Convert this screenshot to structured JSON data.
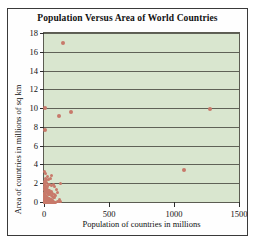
{
  "chart_data": {
    "type": "scatter",
    "title": "Population Versus Area of World Countries",
    "xlabel": "Population of countries in millions",
    "ylabel": "Area of countries in millions of sq km",
    "xlim": [
      0,
      1500
    ],
    "ylim": [
      0,
      18
    ],
    "xticks": [
      "0",
      "500",
      "1000",
      "1500"
    ],
    "xtick_values": [
      0,
      500,
      1000,
      1500
    ],
    "yticks": [
      "0",
      "2",
      "4",
      "6",
      "8",
      "10",
      "12",
      "14",
      "16",
      "18"
    ],
    "ytick_values": [
      0,
      2,
      4,
      6,
      8,
      10,
      12,
      14,
      16,
      18
    ],
    "grid": "horizontal",
    "legend": "none",
    "marker_color": "#c8796a",
    "plot_background": "#d9e6cf",
    "series": [
      {
        "name": "World countries",
        "points": [
          [
            145,
            16.9
          ],
          [
            1280,
            9.9
          ],
          [
            210,
            9.6
          ],
          [
            8,
            9.98
          ],
          [
            115,
            9.2
          ],
          [
            5,
            7.7
          ],
          [
            1080,
            3.4
          ],
          [
            128,
            2.0
          ],
          [
            60,
            2.8
          ],
          [
            48,
            2.5
          ],
          [
            38,
            2.4
          ],
          [
            30,
            2.7
          ],
          [
            22,
            2.4
          ],
          [
            18,
            2.1
          ],
          [
            14,
            2.3
          ],
          [
            10,
            2.0
          ],
          [
            8,
            2.5
          ],
          [
            6,
            2.2
          ],
          [
            36,
            1.9
          ],
          [
            44,
            1.9
          ],
          [
            56,
            1.8
          ],
          [
            70,
            1.9
          ],
          [
            82,
            1.6
          ],
          [
            96,
            1.3
          ],
          [
            104,
            1.0
          ],
          [
            2,
            1.9
          ],
          [
            3,
            1.6
          ],
          [
            5,
            1.5
          ],
          [
            7,
            1.3
          ],
          [
            9,
            1.6
          ],
          [
            11,
            1.4
          ],
          [
            13,
            1.2
          ],
          [
            15,
            1.5
          ],
          [
            17,
            1.3
          ],
          [
            19,
            1.1
          ],
          [
            21,
            1.4
          ],
          [
            23,
            1.2
          ],
          [
            25,
            1.0
          ],
          [
            27,
            1.3
          ],
          [
            29,
            0.9
          ],
          [
            31,
            1.2
          ],
          [
            33,
            0.8
          ],
          [
            35,
            1.1
          ],
          [
            40,
            0.9
          ],
          [
            43,
            1.2
          ],
          [
            46,
            0.8
          ],
          [
            50,
            1.0
          ],
          [
            54,
            0.7
          ],
          [
            58,
            1.1
          ],
          [
            64,
            0.6
          ],
          [
            68,
            0.9
          ],
          [
            74,
            0.5
          ],
          [
            78,
            0.8
          ],
          [
            84,
            0.45
          ],
          [
            90,
            0.7
          ],
          [
            1,
            1.0
          ],
          [
            2,
            0.8
          ],
          [
            3,
            0.6
          ],
          [
            4,
            0.9
          ],
          [
            5,
            0.7
          ],
          [
            6,
            0.5
          ],
          [
            7,
            0.8
          ],
          [
            8,
            0.6
          ],
          [
            9,
            0.4
          ],
          [
            10,
            0.7
          ],
          [
            11,
            0.55
          ],
          [
            12,
            0.35
          ],
          [
            13,
            0.65
          ],
          [
            14,
            0.45
          ],
          [
            15,
            0.3
          ],
          [
            16,
            0.6
          ],
          [
            17,
            0.4
          ],
          [
            18,
            0.25
          ],
          [
            19,
            0.55
          ],
          [
            20,
            0.35
          ],
          [
            21,
            0.2
          ],
          [
            22,
            0.5
          ],
          [
            23,
            0.3
          ],
          [
            24,
            0.18
          ],
          [
            25,
            0.45
          ],
          [
            26,
            0.28
          ],
          [
            27,
            0.15
          ],
          [
            28,
            0.4
          ],
          [
            30,
            0.25
          ],
          [
            32,
            0.12
          ],
          [
            34,
            0.38
          ],
          [
            36,
            0.22
          ],
          [
            38,
            0.1
          ],
          [
            41,
            0.33
          ],
          [
            45,
            0.2
          ],
          [
            49,
            0.28
          ],
          [
            53,
            0.15
          ],
          [
            57,
            0.24
          ],
          [
            62,
            0.12
          ],
          [
            66,
            0.2
          ],
          [
            72,
            0.1
          ],
          [
            0.5,
            0.45
          ],
          [
            1,
            0.3
          ],
          [
            1.5,
            0.18
          ],
          [
            2,
            0.12
          ],
          [
            2.5,
            0.35
          ],
          [
            3,
            0.22
          ],
          [
            3.5,
            0.1
          ],
          [
            4,
            0.28
          ],
          [
            4.5,
            0.15
          ],
          [
            5,
            0.08
          ],
          [
            5.5,
            0.25
          ],
          [
            6,
            0.13
          ],
          [
            6.5,
            0.06
          ],
          [
            7,
            0.2
          ],
          [
            7.5,
            0.1
          ],
          [
            8,
            0.05
          ],
          [
            8.5,
            0.17
          ],
          [
            9,
            0.08
          ],
          [
            9.5,
            0.04
          ],
          [
            10,
            0.14
          ],
          [
            11,
            0.07
          ],
          [
            12,
            0.03
          ],
          [
            13,
            0.11
          ],
          [
            14,
            0.06
          ],
          [
            15,
            0.02
          ],
          [
            16,
            0.09
          ],
          [
            17,
            0.05
          ],
          [
            18,
            0.02
          ],
          [
            20,
            0.08
          ],
          [
            22,
            0.04
          ],
          [
            24,
            0.02
          ],
          [
            26,
            0.07
          ],
          [
            28,
            0.03
          ],
          [
            31,
            0.05
          ],
          [
            35,
            0.02
          ],
          [
            39,
            0.04
          ],
          [
            44,
            0.02
          ],
          [
            52,
            0.03
          ],
          [
            60,
            0.02
          ],
          [
            2,
            3.3
          ],
          [
            9,
            3.0
          ],
          [
            3,
            2.0
          ],
          [
            12,
            1.75
          ],
          [
            6,
            1.28
          ],
          [
            26,
            1.65
          ],
          [
            4,
            0.0
          ],
          [
            7,
            0.0
          ],
          [
            11,
            0.0
          ],
          [
            15,
            0.0
          ],
          [
            19,
            0.0
          ],
          [
            24,
            0.0
          ],
          [
            29,
            0.0
          ],
          [
            33,
            0.0
          ],
          [
            37,
            0.0
          ],
          [
            42,
            0.0
          ],
          [
            47,
            0.0
          ],
          [
            55,
            0.0
          ],
          [
            63,
            0.0
          ],
          [
            71,
            0.0
          ],
          [
            80,
            0.0
          ],
          [
            88,
            0.0
          ],
          [
            100,
            0.05
          ],
          [
            112,
            0.1
          ],
          [
            120,
            0.3
          ],
          [
            130,
            0.08
          ]
        ]
      }
    ]
  }
}
